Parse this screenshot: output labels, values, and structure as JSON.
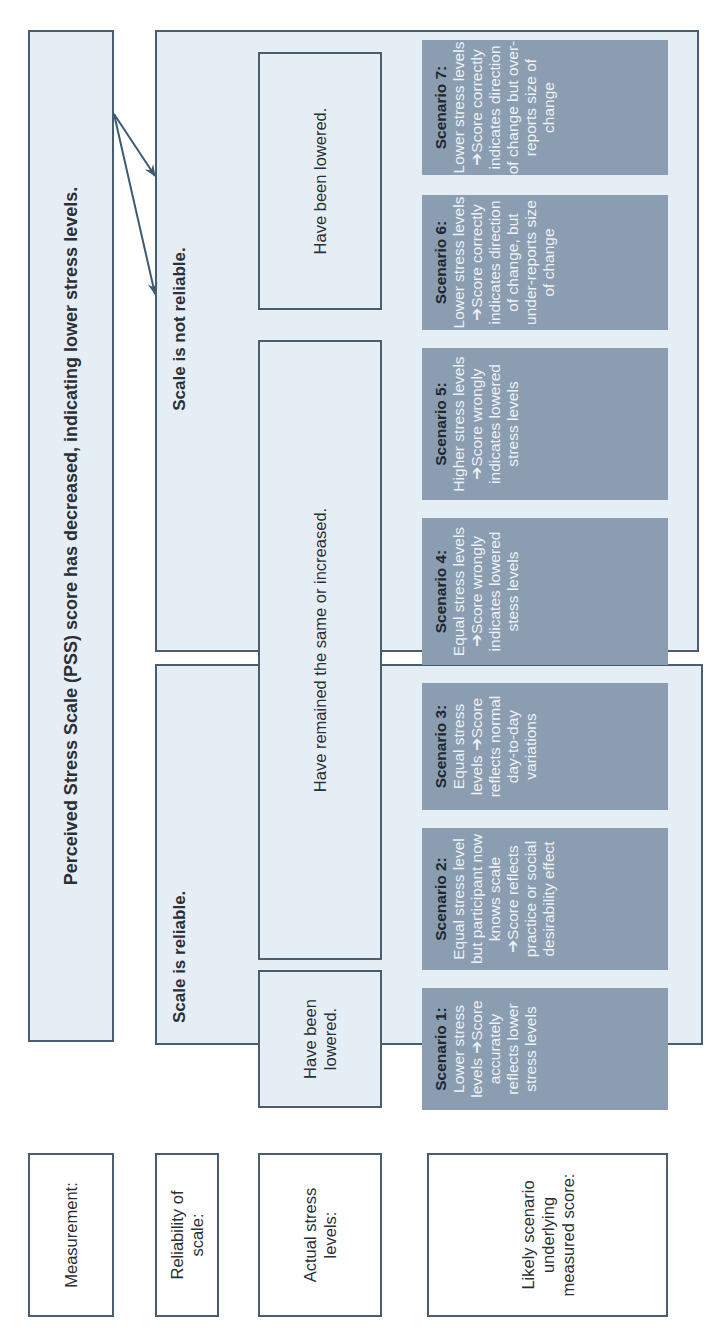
{
  "row_labels": {
    "measurement": "Measurement:",
    "reliability": "Reliability of scale:",
    "actual": "Actual stress levels:",
    "scenario": "Likely scenario underlying measured score:"
  },
  "measurement": {
    "text": "Perceived Stress Scale (PSS) score has decreased, indicating lower stress levels."
  },
  "reliability": {
    "reliable": "Scale is reliable.",
    "not_reliable": "Scale is not reliable."
  },
  "actual": {
    "reliable_lowered": "Have been lowered.",
    "same_or_increased": "Have remained the same or increased.",
    "not_reliable_lowered": "Have been lowered."
  },
  "scenarios": [
    {
      "title": "Scenario 1:",
      "body": "Lower stress levels ➔Score accurately reflects lower stress levels"
    },
    {
      "title": "Scenario 2:",
      "body": "Equal stress level but participant now knows scale ➔Score reflects practice or social desirability effect"
    },
    {
      "title": "Scenario 3:",
      "body": "Equal stress levels ➔Score reflects normal day-to-day variations"
    },
    {
      "title": "Scenario 4:",
      "body": "Equal stress levels ➔Score wrongly indicates lowered stess levels"
    },
    {
      "title": "Scenario 5:",
      "body": "Higher stress levels ➔Score wrongly indicates lowered stress levels"
    },
    {
      "title": "Scenario 6:",
      "body": "Lower stress levels ➔Score correctly indicates direction of change, but under-reports size of change"
    },
    {
      "title": "Scenario 7:",
      "body": "Lower stress levels ➔Score correctly indicates direction of change but over-reports size of change"
    }
  ],
  "colors": {
    "panel_fill": "#e6eef5",
    "border": "#4a5d70",
    "scenario_fill": "#8a9db1",
    "arrow": "#3f5a73"
  }
}
